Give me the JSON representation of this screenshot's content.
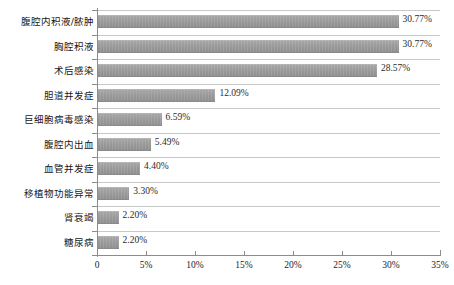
{
  "chart_data": {
    "type": "bar",
    "orientation": "horizontal",
    "title": "",
    "subtitle": "",
    "xlabel": "",
    "ylabel": "",
    "xlim": [
      0,
      35
    ],
    "grid": true,
    "legend": null,
    "categories": [
      "腹腔内积液/脓肿",
      "胸腔积液",
      "术后感染",
      "胆道并发症",
      "巨细胞病毒感染",
      "腹腔内出血",
      "血管并发症",
      "移植物功能异常",
      "肾衰竭",
      "糖尿病"
    ],
    "values": [
      30.77,
      30.77,
      28.57,
      12.09,
      6.59,
      5.49,
      4.4,
      3.3,
      2.2,
      2.2
    ],
    "value_labels": [
      "30.77%",
      "30.77%",
      "28.57%",
      "12.09%",
      "6.59%",
      "5.49%",
      "4.40%",
      "3.30%",
      "2.20%",
      "2.20%"
    ],
    "xticks": [
      0,
      5,
      10,
      15,
      20,
      25,
      30,
      35
    ],
    "xtick_labels": [
      "0",
      "5%",
      "10%",
      "15%",
      "20%",
      "25%",
      "30%",
      "35%"
    ],
    "bar_color": "#9a9a9a",
    "gridline_color": "#c8c8c8",
    "axis_color": "#8c8c8c",
    "background_color": "#ffffff"
  }
}
